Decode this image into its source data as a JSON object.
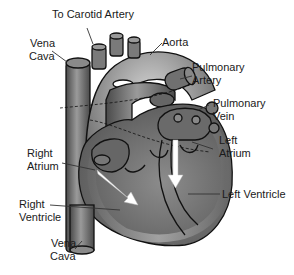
{
  "diagram": {
    "labels": {
      "carotid": "To Carotid Artery",
      "vena_cava_top_1": "Vena",
      "vena_cava_top_2": "Cava",
      "aorta": "Aorta",
      "pulmonary_artery_1": "Pulmonary",
      "pulmonary_artery_2": "Artery",
      "pulmonary_vein_1": "Pulmonary",
      "pulmonary_vein_2": "Vein",
      "left_atrium_1": "Left",
      "left_atrium_2": "Atrium",
      "right_atrium_1": "Right",
      "right_atrium_2": "Atrium",
      "left_ventricle": "Left Ventricle",
      "right_ventricle_1": "Right",
      "right_ventricle_2": "Ventricle",
      "vena_cava_bottom_1": "Vena",
      "vena_cava_bottom_2": "Cava"
    },
    "colors": {
      "tissue_dark": "#5a5a5a",
      "tissue_mid": "#7d7d7d",
      "tissue_light": "#b5b5b5",
      "arrow": "#ffffff",
      "outline": "#111111"
    }
  }
}
